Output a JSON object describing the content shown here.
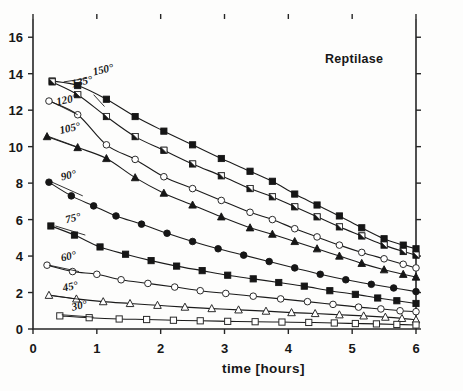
{
  "chart_data": {
    "type": "line",
    "title": "Reptilase",
    "xlabel": "time [hours]",
    "ylabel": "",
    "xlim": [
      0,
      6
    ],
    "ylim": [
      0,
      17
    ],
    "xticks": [
      0,
      1,
      2,
      3,
      4,
      5,
      6
    ],
    "xtick_labels": [
      "0",
      "1",
      "2",
      "3",
      "4",
      "5",
      "6"
    ],
    "yticks": [
      0,
      2,
      4,
      6,
      8,
      10,
      12,
      14,
      16
    ],
    "ytick_labels": [
      "0",
      "2",
      "4",
      "6",
      "8",
      "10",
      "12",
      "14",
      "16"
    ],
    "grid": false,
    "legend": "inline-curve-labels",
    "series": [
      {
        "name": "150°",
        "label": "150°",
        "marker": "filled-square",
        "label_xy": [
          0.95,
          13.9
        ],
        "leader": [
          [
            0.85,
            13.75
          ],
          [
            0.48,
            13.55
          ]
        ],
        "x": [
          0.3,
          0.7,
          1.15,
          1.6,
          2.05,
          2.5,
          2.95,
          3.4,
          3.75,
          4.1,
          4.45,
          4.8,
          5.15,
          5.5,
          5.8,
          6.0
        ],
        "y": [
          13.6,
          13.35,
          12.6,
          11.65,
          10.85,
          10.1,
          9.35,
          8.65,
          8.1,
          7.4,
          6.8,
          6.2,
          5.55,
          4.95,
          4.6,
          4.4
        ]
      },
      {
        "name": "135°",
        "label": "135°",
        "marker": "half-filled-square",
        "label_xy": [
          0.62,
          13.25
        ],
        "leader": [
          [
            0.95,
            12.85
          ],
          [
            1.12,
            12.2
          ]
        ],
        "x": [
          0.3,
          0.7,
          1.15,
          1.6,
          2.05,
          2.5,
          2.95,
          3.4,
          3.75,
          4.1,
          4.45,
          4.8,
          5.15,
          5.5,
          5.8,
          6.0
        ],
        "y": [
          13.55,
          12.85,
          11.65,
          10.55,
          9.8,
          9.05,
          8.4,
          7.7,
          7.25,
          6.7,
          6.15,
          5.6,
          5.1,
          4.6,
          4.25,
          4.05
        ]
      },
      {
        "name": "120°",
        "label": "120°",
        "marker": "open-circle",
        "label_xy": [
          0.38,
          12.25
        ],
        "leader": [
          [
            0.3,
            12.45
          ],
          [
            0.7,
            11.75
          ]
        ],
        "x": [
          0.25,
          0.7,
          1.15,
          1.6,
          2.05,
          2.5,
          2.95,
          3.4,
          3.75,
          4.1,
          4.45,
          4.8,
          5.15,
          5.5,
          5.8,
          6.0
        ],
        "y": [
          12.5,
          11.75,
          10.1,
          9.3,
          8.35,
          7.7,
          7.05,
          6.4,
          6.0,
          5.5,
          5.05,
          4.6,
          4.2,
          3.85,
          3.55,
          3.35
        ]
      },
      {
        "name": "105°",
        "label": "105°",
        "marker": "filled-triangle",
        "label_xy": [
          0.43,
          10.7
        ],
        "leader": [
          [
            0.25,
            10.55
          ],
          [
            0.72,
            9.95
          ]
        ],
        "x": [
          0.22,
          0.7,
          1.15,
          1.6,
          2.05,
          2.5,
          2.95,
          3.4,
          3.75,
          4.1,
          4.45,
          4.8,
          5.15,
          5.5,
          5.8,
          6.0
        ],
        "y": [
          10.55,
          9.95,
          9.35,
          8.3,
          7.45,
          6.8,
          6.15,
          5.55,
          5.2,
          4.8,
          4.4,
          4.0,
          3.6,
          3.25,
          3.0,
          2.85
        ]
      },
      {
        "name": "90°",
        "label": "90°",
        "marker": "filled-circle",
        "label_xy": [
          0.45,
          8.15
        ],
        "leader": [
          [
            0.3,
            8.05
          ],
          [
            0.78,
            7.3
          ]
        ],
        "x": [
          0.25,
          0.6,
          0.95,
          1.3,
          1.7,
          2.1,
          2.5,
          2.9,
          3.3,
          3.7,
          4.1,
          4.5,
          4.9,
          5.3,
          5.65,
          6.0
        ],
        "y": [
          8.05,
          7.3,
          6.75,
          6.2,
          5.75,
          5.25,
          4.8,
          4.4,
          4.05,
          3.7,
          3.35,
          3.0,
          2.7,
          2.45,
          2.25,
          2.05
        ]
      },
      {
        "name": "75°",
        "label": "75°",
        "marker": "filled-square",
        "label_xy": [
          0.52,
          5.8
        ],
        "leader": [
          [
            0.35,
            5.65
          ],
          [
            0.82,
            5.15
          ]
        ],
        "x": [
          0.28,
          0.65,
          1.05,
          1.45,
          1.85,
          2.25,
          2.65,
          3.05,
          3.45,
          3.85,
          4.25,
          4.65,
          5.05,
          5.4,
          5.7,
          6.0
        ],
        "y": [
          5.65,
          5.15,
          4.5,
          4.1,
          3.75,
          3.45,
          3.2,
          2.95,
          2.75,
          2.55,
          2.35,
          2.1,
          1.9,
          1.7,
          1.55,
          1.4
        ]
      },
      {
        "name": "60°",
        "label": "60°",
        "marker": "open-circle",
        "label_xy": [
          0.45,
          3.7
        ],
        "leader": [
          [
            0.25,
            3.5
          ],
          [
            0.72,
            3.15
          ]
        ],
        "x": [
          0.22,
          0.62,
          1.0,
          1.38,
          1.8,
          2.22,
          2.62,
          3.02,
          3.45,
          3.88,
          4.3,
          4.7,
          5.1,
          5.45,
          5.75,
          6.0
        ],
        "y": [
          3.5,
          3.15,
          3.0,
          2.7,
          2.5,
          2.3,
          2.1,
          1.95,
          1.8,
          1.65,
          1.5,
          1.35,
          1.2,
          1.1,
          1.0,
          0.95
        ]
      },
      {
        "name": "45°",
        "label": "45°",
        "marker": "open-triangle",
        "label_xy": [
          0.48,
          2.05
        ],
        "leader": [
          [
            0.28,
            1.85
          ],
          [
            0.78,
            1.6
          ]
        ],
        "x": [
          0.25,
          0.68,
          1.1,
          1.52,
          1.95,
          2.38,
          2.8,
          3.22,
          3.65,
          4.05,
          4.42,
          4.8,
          5.18,
          5.52,
          5.78,
          6.0
        ],
        "y": [
          1.85,
          1.65,
          1.5,
          1.4,
          1.3,
          1.2,
          1.12,
          1.05,
          0.98,
          0.9,
          0.85,
          0.78,
          0.72,
          0.65,
          0.58,
          0.5
        ]
      },
      {
        "name": "30°",
        "label": "30°",
        "marker": "open-square",
        "label_xy": [
          0.62,
          1.0
        ],
        "leader": [
          [
            0.45,
            0.78
          ],
          [
            0.95,
            0.65
          ]
        ],
        "x": [
          0.42,
          0.88,
          1.35,
          1.78,
          2.2,
          2.62,
          3.05,
          3.48,
          3.9,
          4.32,
          4.72,
          5.05,
          5.38,
          5.7,
          6.0
        ],
        "y": [
          0.72,
          0.62,
          0.55,
          0.52,
          0.48,
          0.45,
          0.42,
          0.4,
          0.38,
          0.36,
          0.33,
          0.3,
          0.28,
          0.25,
          0.22
        ]
      }
    ]
  },
  "geometry": {
    "left": 33,
    "right": 416,
    "top": 19,
    "bottom": 329,
    "title_xy": [
      325,
      63
    ],
    "xlabel_xy": [
      222,
      373
    ]
  }
}
